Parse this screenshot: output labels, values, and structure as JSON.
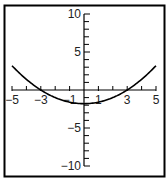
{
  "chart_data": {
    "type": "line",
    "title": "",
    "xlabel": "",
    "ylabel": "",
    "xlim": [
      -5,
      5
    ],
    "ylim": [
      -10,
      10
    ],
    "grid": false,
    "x_tick_labels": [
      "-5",
      "-3",
      "-1",
      "1",
      "3",
      "5"
    ],
    "x_ticks": [
      -5,
      -4,
      -3,
      -2,
      -1,
      0,
      1,
      2,
      3,
      4,
      5
    ],
    "y_tick_labels": [
      "10",
      "5",
      "-5",
      "-10"
    ],
    "y_ticks": [
      -10,
      -9,
      -8,
      -7,
      -6,
      -5,
      -4,
      -3,
      -2,
      -1,
      0,
      1,
      2,
      3,
      4,
      5,
      6,
      7,
      8,
      9,
      10
    ],
    "series": [
      {
        "name": "parabola",
        "x": [
          -5,
          -4,
          -3,
          -2,
          -1,
          0,
          1,
          2,
          3,
          4,
          5
        ],
        "values": [
          3.2,
          1.4,
          0,
          -1,
          -1.6,
          -1.8,
          -1.6,
          -1,
          0,
          1.4,
          3.2
        ]
      }
    ],
    "colors": {
      "axis": "#000000",
      "curve": "#000000",
      "border": "#000000"
    }
  }
}
